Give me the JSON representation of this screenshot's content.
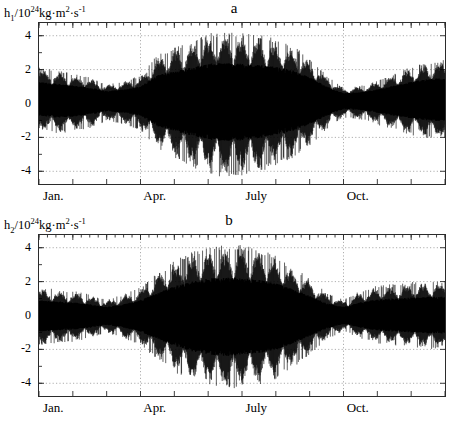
{
  "figure": {
    "panels": [
      {
        "id": "a",
        "title": "a",
        "ylabel_html": "h<sub>1</sub>/10<sup>24</sup>kg·m<sup>2</sup>·s<sup>-1</sup>",
        "ylabel_text": "h1/10^24 kg·m^2·s^-1"
      },
      {
        "id": "b",
        "title": "b",
        "ylabel_html": "h<sub>2</sub>/10<sup>24</sup>kg·m<sup>2</sup>·s<sup>-1</sup>",
        "ylabel_text": "h2/10^24 kg·m^2·s^-1"
      }
    ]
  },
  "chart_data": [
    {
      "type": "line",
      "id": "a",
      "title": "a",
      "xlabel": "",
      "ylabel": "h1/10^24 kg·m^2·s^-1",
      "ylim": [
        -4.75,
        4.75
      ],
      "yticks": [
        4,
        2,
        0,
        -2,
        -4
      ],
      "ytick_labels": [
        "4",
        "2",
        "0",
        "-2",
        "-4"
      ],
      "xlim": [
        0,
        12
      ],
      "xticks": [
        0,
        1,
        2,
        3,
        4,
        5,
        6,
        7,
        8,
        9,
        10,
        11,
        12
      ],
      "xtick_labels": [
        "Jan.",
        "",
        "",
        "Apr.",
        "",
        "",
        "July",
        "",
        "",
        "Oct.",
        "",
        "",
        ""
      ],
      "xtick_label_positions": [
        0.45,
        3.45,
        6.45,
        9.45
      ],
      "grid": true,
      "grid_style": "dotted",
      "grid_y": [
        4,
        2,
        -2,
        -4
      ],
      "grid_x": [
        3,
        9
      ],
      "minor_xticks": true,
      "series_description": "Dense high-frequency oscillation with amplitude-modulated envelope; near-daily sampling of axial angular momentum component.",
      "envelope": {
        "x_months": [
          0,
          0.5,
          1,
          1.5,
          2,
          2.5,
          3,
          3.5,
          4,
          4.5,
          5,
          5.5,
          6,
          6.5,
          7,
          7.5,
          8,
          8.5,
          9,
          9.5,
          10,
          10.5,
          11,
          11.5,
          12
        ],
        "upper": [
          2.1,
          1.9,
          1.7,
          1.5,
          1.1,
          1.3,
          1.6,
          2.8,
          3.2,
          3.6,
          4.0,
          4.1,
          4.0,
          3.9,
          3.7,
          3.3,
          2.6,
          1.6,
          0.9,
          1.0,
          1.3,
          1.7,
          2.1,
          2.4,
          2.5
        ],
        "lower": [
          -1.5,
          -1.7,
          -1.6,
          -1.4,
          -1.0,
          -1.2,
          -1.5,
          -2.6,
          -3.1,
          -3.6,
          -4.0,
          -4.2,
          -4.1,
          -3.9,
          -3.5,
          -3.1,
          -2.4,
          -1.5,
          -0.8,
          -0.9,
          -1.2,
          -1.5,
          -1.8,
          -2.0,
          -2.1
        ]
      },
      "mean_offset": 0.25,
      "peak_positive": 4.2,
      "peak_negative": -4.3
    },
    {
      "type": "line",
      "id": "b",
      "title": "b",
      "xlabel": "",
      "ylabel": "h2/10^24 kg·m^2·s^-1",
      "ylim": [
        -4.75,
        4.75
      ],
      "yticks": [
        4,
        2,
        0,
        -2,
        -4
      ],
      "ytick_labels": [
        "4",
        "2",
        "0",
        "-2",
        "-4"
      ],
      "xlim": [
        0,
        12
      ],
      "xticks": [
        0,
        1,
        2,
        3,
        4,
        5,
        6,
        7,
        8,
        9,
        10,
        11,
        12
      ],
      "xtick_labels": [
        "Jan.",
        "",
        "",
        "Apr.",
        "",
        "",
        "July",
        "",
        "",
        "Oct.",
        "",
        "",
        ""
      ],
      "xtick_label_positions": [
        0.45,
        3.45,
        6.45,
        9.45
      ],
      "grid": true,
      "grid_style": "dotted",
      "grid_y": [
        4,
        2,
        -2,
        -4
      ],
      "grid_x": [
        3,
        9
      ],
      "minor_xticks": true,
      "series_description": "Dense high-frequency oscillation with smooth symmetric amplitude envelope peaking mid-year.",
      "envelope": {
        "x_months": [
          0,
          0.5,
          1,
          1.5,
          2,
          2.5,
          3,
          3.5,
          4,
          4.5,
          5,
          5.5,
          6,
          6.5,
          7,
          7.5,
          8,
          8.5,
          9,
          9.5,
          10,
          10.5,
          11,
          11.5,
          12
        ],
        "upper": [
          1.6,
          1.5,
          1.4,
          1.2,
          0.9,
          1.2,
          1.6,
          2.4,
          3.1,
          3.6,
          3.9,
          4.0,
          4.0,
          3.8,
          3.4,
          2.8,
          2.1,
          1.3,
          0.9,
          1.4,
          1.7,
          1.8,
          1.9,
          2.0,
          2.0
        ],
        "lower": [
          -1.7,
          -1.6,
          -1.5,
          -1.3,
          -1.0,
          -1.3,
          -1.7,
          -2.5,
          -3.2,
          -3.8,
          -4.1,
          -4.3,
          -4.2,
          -4.0,
          -3.6,
          -3.0,
          -2.2,
          -1.4,
          -0.9,
          -1.3,
          -1.6,
          -1.7,
          -1.8,
          -1.9,
          -1.9
        ]
      },
      "mean_offset": 0.0,
      "peak_positive": 4.2,
      "peak_negative": -4.5
    }
  ],
  "style": {
    "line_color": "#000000",
    "frame_color": "#2b2b2b",
    "grid_color": "#9a9a9a",
    "background": "#ffffff"
  }
}
